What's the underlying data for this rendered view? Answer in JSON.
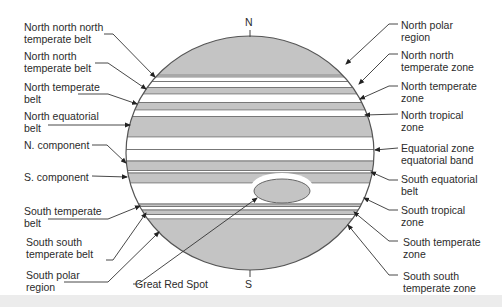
{
  "diagram": {
    "poles": {
      "north": "N",
      "south": "S"
    },
    "colors": {
      "belt_fill": "#c4c4c4",
      "zone_fill": "#ffffff",
      "outline": "#555555",
      "text": "#2b2b2b",
      "leader": "#333333"
    },
    "labels_left": [
      {
        "id": "nnn-temperate-belt",
        "text": "North north north\ntemperate belt"
      },
      {
        "id": "nn-temperate-belt",
        "text": "North north\ntemperate belt"
      },
      {
        "id": "n-temperate-belt",
        "text": "North temperate\nbelt"
      },
      {
        "id": "n-equatorial-belt",
        "text": "North equatorial\nbelt"
      },
      {
        "id": "n-component",
        "text": "N. component"
      },
      {
        "id": "s-component",
        "text": "S. component"
      },
      {
        "id": "s-temperate-belt",
        "text": "South temperate\nbelt"
      },
      {
        "id": "ss-temperate-belt",
        "text": "South south\ntemperate belt"
      },
      {
        "id": "s-polar-region",
        "text": "South polar\nregion"
      }
    ],
    "labels_right": [
      {
        "id": "n-polar-region",
        "text": "North polar\nregion"
      },
      {
        "id": "nn-temperate-zone",
        "text": "North north\ntemperate zone"
      },
      {
        "id": "n-temperate-zone",
        "text": "North temperate\nzone"
      },
      {
        "id": "n-tropical-zone",
        "text": "North tropical\nzone"
      },
      {
        "id": "equatorial-zone",
        "text": "Equatorial zone\nequatorial band"
      },
      {
        "id": "s-equatorial-belt",
        "text": "South equatorial\nbelt"
      },
      {
        "id": "s-tropical-zone",
        "text": "South tropical\nzone"
      },
      {
        "id": "s-temperate-zone",
        "text": "South temperate\nzone"
      },
      {
        "id": "ss-temperate-zone",
        "text": "South south\ntemperate zone"
      }
    ],
    "label_bottom": {
      "id": "great-red-spot",
      "text": "Great Red Spot"
    }
  }
}
